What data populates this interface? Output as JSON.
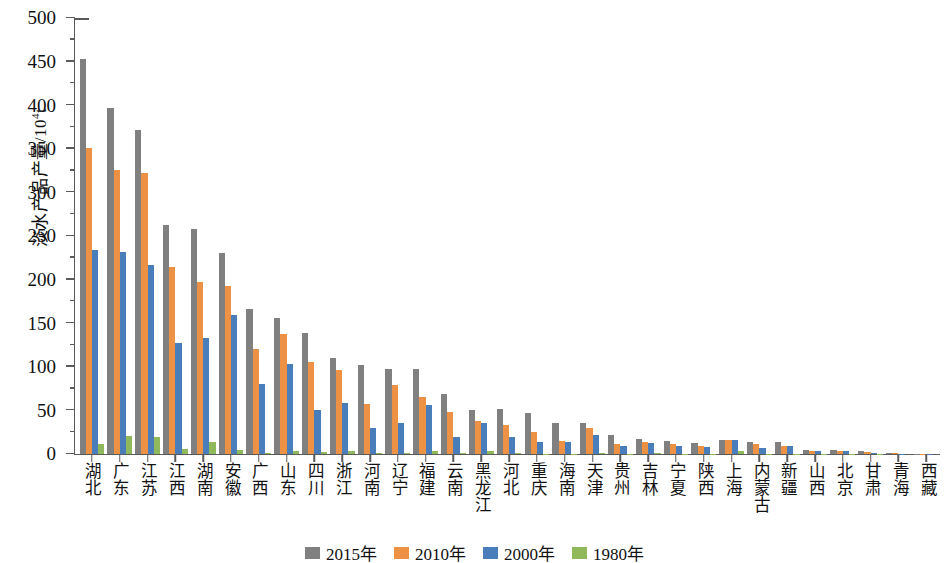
{
  "chart_data": {
    "type": "bar",
    "title": "",
    "xlabel": "",
    "ylabel": "淡水产品产量/10⁴t",
    "ylabel_main": "淡水产品产量/10",
    "ylabel_exp": "4",
    "ylabel_unit": "t",
    "ylim": [
      0,
      500
    ],
    "ytick_step": 50,
    "yticks": [
      0,
      50,
      100,
      150,
      200,
      250,
      300,
      350,
      400,
      450,
      500
    ],
    "ytick_labels": [
      "0",
      "50",
      "100",
      "150",
      "200",
      "250",
      "300",
      "350",
      "400",
      "450",
      "500"
    ],
    "grid": false,
    "legend_position": "bottom-center",
    "categories": [
      "湖北",
      "广东",
      "江苏",
      "江西",
      "湖南",
      "安徽",
      "广西",
      "山东",
      "四川",
      "浙江",
      "河南",
      "辽宁",
      "福建",
      "云南",
      "黑龙江",
      "河北",
      "重庆",
      "海南",
      "天津",
      "贵州",
      "吉林",
      "宁夏",
      "陕西",
      "上海",
      "内蒙古",
      "新疆",
      "山西",
      "北京",
      "甘肃",
      "青海",
      "西藏"
    ],
    "series": [
      {
        "name": "2015年",
        "color": "#808080",
        "values": [
          453,
          397,
          372,
          263,
          258,
          230,
          166,
          156,
          139,
          110,
          102,
          98,
          97,
          69,
          51,
          52,
          47,
          36,
          35,
          22,
          17,
          15,
          13,
          16,
          14,
          14,
          5,
          5,
          3,
          1,
          0.4
        ]
      },
      {
        "name": "2010年",
        "color": "#ed9144",
        "values": [
          351,
          326,
          322,
          215,
          197,
          193,
          121,
          138,
          105,
          96,
          57,
          79,
          65,
          48,
          38,
          33,
          25,
          15,
          30,
          12,
          14,
          11,
          9,
          16,
          11,
          9,
          4,
          4,
          2,
          0.8,
          0.2
        ]
      },
      {
        "name": "2000年",
        "color": "#4a7ebb",
        "values": [
          234,
          232,
          217,
          127,
          133,
          159,
          80,
          103,
          50,
          58,
          30,
          35,
          56,
          19,
          36,
          20,
          14,
          14,
          22,
          9,
          13,
          9,
          8,
          16,
          7,
          9,
          3,
          4,
          1,
          0.3,
          0.1
        ]
      },
      {
        "name": "1980年",
        "color": "#8fb95a",
        "values": [
          12,
          21,
          19,
          6,
          14,
          5,
          1,
          3,
          2,
          4,
          1,
          1,
          4,
          1,
          3,
          1,
          0.5,
          0.5,
          1,
          0.3,
          1,
          0.3,
          0.3,
          3,
          0.3,
          0.3,
          0.2,
          0.5,
          0.1,
          0.05,
          0.02
        ]
      }
    ]
  },
  "legend": {
    "items": [
      {
        "label": "2015年",
        "key": "s2015",
        "color": "#808080"
      },
      {
        "label": "2010年",
        "key": "s2010",
        "color": "#ed9144"
      },
      {
        "label": "2000年",
        "key": "s2000",
        "color": "#4a7ebb"
      },
      {
        "label": "1980年",
        "key": "s1980",
        "color": "#8fb95a"
      }
    ]
  }
}
